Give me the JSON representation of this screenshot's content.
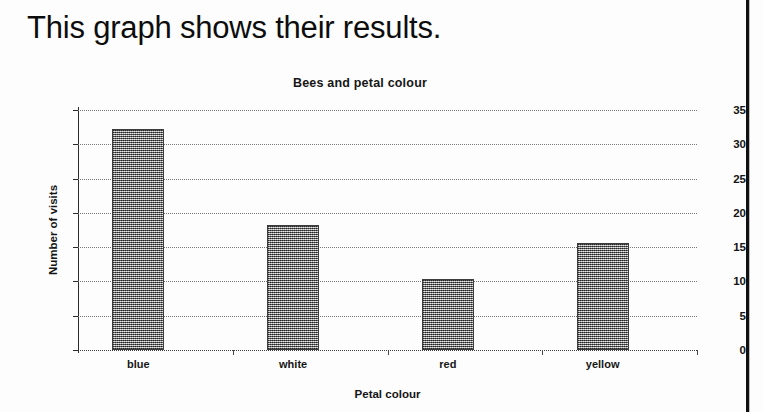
{
  "heading": "This graph shows their results.",
  "chart_data": {
    "type": "bar",
    "title": "Bees and petal colour",
    "xlabel": "Petal colour",
    "ylabel": "Number of visits",
    "categories": [
      "blue",
      "white",
      "red",
      "yellow"
    ],
    "values": [
      32.2,
      18.3,
      10.4,
      15.6
    ],
    "ylim": [
      0,
      35
    ],
    "yticks": [
      "0",
      "5",
      "10",
      "15",
      "20",
      "25",
      "30",
      "35"
    ],
    "ytick_values": [
      0,
      5,
      10,
      15,
      20,
      25,
      30,
      35
    ],
    "grid": true,
    "legend": null,
    "series": [
      {
        "name": "Number of visits",
        "values": [
          32.2,
          18.3,
          10.4,
          15.6
        ]
      }
    ],
    "bar_fill": "#9d9d9d",
    "bar_edge": "#3c3c3c",
    "gridline_color": "#777777",
    "axis_color": "#2a2a2a"
  }
}
